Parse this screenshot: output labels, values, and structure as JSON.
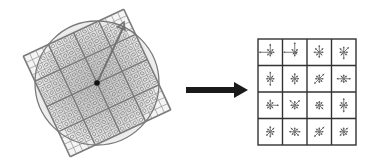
{
  "diagram": {
    "title": "Keypoint descriptor: rotated gradient sample grid to orientation histogram grid",
    "left_panel": {
      "label": "Image gradients sampled in rotated window",
      "center": [
        97,
        83
      ],
      "rotation_deg": -25,
      "square_side": 111,
      "blocks": 4,
      "subcells_per_block": 4,
      "circle_radius": 62,
      "orientation_arrow_end": [
        124,
        22
      ]
    },
    "transition_arrow": {
      "label": "maps to",
      "from": [
        186,
        90
      ],
      "to": [
        248,
        90
      ]
    },
    "right_panel": {
      "label": "Keypoint descriptor (4x4 histogram grid)",
      "origin": [
        258,
        39
      ],
      "size": [
        98,
        106
      ],
      "rows": 4,
      "cols": 4,
      "bins_per_cell": 8,
      "histograms": [
        [
          [
            6,
            3,
            3,
            2,
            3,
            3,
            8,
            3
          ],
          [
            7,
            3,
            2,
            2,
            3,
            2,
            8,
            3
          ],
          [
            5,
            4,
            3,
            3,
            4,
            3,
            4,
            4
          ],
          [
            4,
            5,
            3,
            3,
            5,
            3,
            3,
            4
          ]
        ],
        [
          [
            5,
            3,
            3,
            3,
            5,
            3,
            3,
            3
          ],
          [
            4,
            3,
            3,
            3,
            4,
            3,
            3,
            3
          ],
          [
            3,
            5,
            3,
            3,
            3,
            5,
            3,
            3
          ],
          [
            3,
            3,
            5,
            3,
            3,
            3,
            5,
            3
          ]
        ],
        [
          [
            4,
            3,
            6,
            3,
            3,
            3,
            3,
            3
          ],
          [
            3,
            5,
            3,
            3,
            3,
            3,
            3,
            5
          ],
          [
            3,
            3,
            3,
            4,
            3,
            3,
            3,
            3
          ],
          [
            5,
            3,
            3,
            3,
            5,
            3,
            3,
            3
          ]
        ],
        [
          [
            4,
            4,
            3,
            3,
            4,
            4,
            3,
            3
          ],
          [
            3,
            3,
            4,
            4,
            3,
            3,
            4,
            4
          ],
          [
            3,
            5,
            3,
            3,
            3,
            5,
            3,
            3
          ],
          [
            3,
            4,
            3,
            3,
            3,
            4,
            3,
            3
          ]
        ]
      ]
    },
    "colors": {
      "grid_line": "#8a8a8a",
      "grid_line_thick": "#7a7a7a",
      "circle": "#7a7a7a",
      "shade": "#cfcfcf",
      "center_dot": "#111111",
      "big_arrow": "#1a1a1a",
      "desc_border": "#333333",
      "star": "#555555"
    }
  }
}
